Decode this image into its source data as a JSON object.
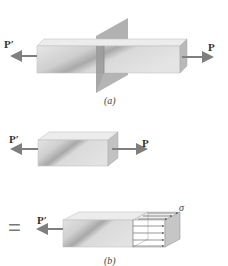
{
  "figure_a": {
    "caption": "(a)",
    "left_force_label": "P′",
    "right_force_label": "P",
    "description": "Prismatic bar under axial tensile loads P and P′, cut by a transverse plane"
  },
  "figure_b": {
    "caption": "(b)",
    "top_left_force_label": "P′",
    "top_right_force_label": "P",
    "equals_sign": "=",
    "bottom_left_force_label": "P′",
    "stress_label": "σ",
    "description": "Free body of bar portion; internal force replaced by distributed normal stress σ"
  },
  "colors": {
    "arrow": "#7f7f7f",
    "bar_face": "#d8d8d8",
    "bar_top": "#e8e8e8",
    "bar_side": "#b8b8b8",
    "plane": "#9a9a9a",
    "stress_lines": "#6a6a6a"
  }
}
